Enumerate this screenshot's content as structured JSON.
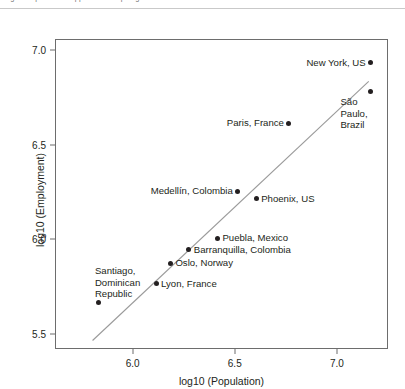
{
  "caption": {
    "remnant_text": "Figure caption text clipped at the top edge of the screenshot"
  },
  "chart_data": {
    "type": "scatter",
    "title": "",
    "xlabel": "log10 (Population)",
    "ylabel": "log10 (Employment)",
    "xlim": [
      5.62,
      7.25
    ],
    "ylim": [
      5.42,
      7.06
    ],
    "xticks": [
      "6.0",
      "6.5",
      "7.0"
    ],
    "xtick_values": [
      6.0,
      6.5,
      7.0
    ],
    "yticks": [
      "7.0",
      "6.5",
      "6.0",
      "5.5"
    ],
    "ytick_values": [
      7.0,
      6.5,
      6.0,
      5.5
    ],
    "grid": false,
    "legend": "none",
    "point_color": "#231f20",
    "trendline_color": "#9a9a9a",
    "trendline": {
      "x": [
        5.8,
        7.16
      ],
      "y": [
        5.46,
        6.84
      ]
    },
    "points": [
      {
        "label": "New York, US",
        "x": 7.16,
        "y": 6.94,
        "label_pos": "left"
      },
      {
        "label": "São Paulo,\nBrazil",
        "x": 7.16,
        "y": 6.79,
        "label_pos": "below-left",
        "label_lines": [
          "São",
          "Paulo,",
          "Brazil"
        ]
      },
      {
        "label": "Paris, France",
        "x": 6.76,
        "y": 6.62,
        "label_pos": "left"
      },
      {
        "label": "Medellín, Colombia",
        "x": 6.51,
        "y": 6.26,
        "label_pos": "left"
      },
      {
        "label": "Phoenix, US",
        "x": 6.6,
        "y": 6.22,
        "label_pos": "right"
      },
      {
        "label": "Puebla, Mexico",
        "x": 6.41,
        "y": 6.01,
        "label_pos": "right"
      },
      {
        "label": "Barranquilla, Colombia",
        "x": 6.27,
        "y": 5.95,
        "label_pos": "right"
      },
      {
        "label": "Oslo, Norway",
        "x": 6.18,
        "y": 5.88,
        "label_pos": "right"
      },
      {
        "label": "Lyon, France",
        "x": 6.11,
        "y": 5.77,
        "label_pos": "right"
      },
      {
        "label": "Santiago,\nDominican\nRepublic",
        "x": 5.83,
        "y": 5.67,
        "label_pos": "above",
        "label_lines": [
          "Santiago,",
          "Dominican",
          "Republic"
        ]
      }
    ]
  }
}
